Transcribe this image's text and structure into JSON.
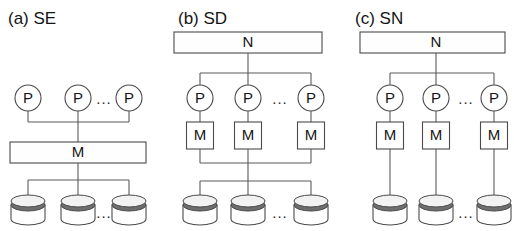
{
  "figure": {
    "background_color": "#ffffff",
    "line_color": "#5a5a5a",
    "text_color": "#141414",
    "disk_band_color": "#6e6e6e",
    "ellipsis": "...",
    "panels": [
      {
        "id": "panel-se",
        "title": "(a) SE",
        "architecture": "shared everything",
        "title_x": 8,
        "title_y": 24,
        "processors": {
          "label": "P",
          "count_shown": 3,
          "centers_x": [
            28,
            78,
            129
          ],
          "center_y": 98,
          "radius": 13
        },
        "memory_bar": {
          "label": "M",
          "x": 10,
          "y": 142,
          "width": 136,
          "height": 21
        },
        "disks": {
          "count_shown": 3,
          "centers_x": [
            28,
            78,
            129
          ],
          "top_y": 201,
          "width": 34,
          "height": 22
        },
        "buses": [
          {
            "name": "processor-bus",
            "y": 122,
            "x1": 28,
            "x2": 129
          },
          {
            "name": "disk-bus",
            "y": 180,
            "x1": 28,
            "x2": 129
          }
        ],
        "ellipsis_points": [
          {
            "x": 104,
            "y": 100
          },
          {
            "x": 104,
            "y": 214
          }
        ]
      },
      {
        "id": "panel-sd",
        "title": "(b) SD",
        "architecture": "shared disk",
        "title_x": 178,
        "title_y": 24,
        "network_bar": {
          "label": "N",
          "x": 174,
          "y": 32,
          "width": 148,
          "height": 21
        },
        "processors": {
          "label": "P",
          "count_shown": 3,
          "centers_x": [
            200,
            248,
            311
          ],
          "center_y": 98,
          "radius": 13
        },
        "memories": {
          "label": "M",
          "count_shown": 3,
          "centers_x": [
            200,
            248,
            311
          ],
          "y": 122,
          "width": 27,
          "height": 27
        },
        "disks": {
          "count_shown": 3,
          "centers_x": [
            200,
            248,
            311
          ],
          "top_y": 201,
          "width": 34,
          "height": 22
        },
        "buses": [
          {
            "name": "network-bus",
            "y": 73,
            "x1": 200,
            "x2": 311
          },
          {
            "name": "memory-bus",
            "y": 163,
            "x1": 200,
            "x2": 311
          },
          {
            "name": "disk-bus",
            "y": 181,
            "x1": 200,
            "x2": 311
          }
        ],
        "ellipsis_points": [
          {
            "x": 280,
            "y": 100
          },
          {
            "x": 280,
            "y": 214
          }
        ]
      },
      {
        "id": "panel-sn",
        "title": "(c) SN",
        "architecture": "shared nothing",
        "title_x": 355,
        "title_y": 24,
        "network_bar": {
          "label": "N",
          "x": 360,
          "y": 32,
          "width": 145,
          "height": 21
        },
        "processors": {
          "label": "P",
          "count_shown": 3,
          "centers_x": [
            390,
            436,
            494
          ],
          "center_y": 98,
          "radius": 13
        },
        "memories": {
          "label": "M",
          "count_shown": 3,
          "centers_x": [
            390,
            436,
            494
          ],
          "y": 122,
          "width": 27,
          "height": 27
        },
        "disks": {
          "count_shown": 3,
          "centers_x": [
            390,
            436,
            494
          ],
          "top_y": 201,
          "width": 34,
          "height": 22
        },
        "buses": [
          {
            "name": "network-bus",
            "y": 73,
            "x1": 390,
            "x2": 494
          }
        ],
        "ellipsis_points": [
          {
            "x": 466,
            "y": 100
          },
          {
            "x": 466,
            "y": 214
          }
        ]
      }
    ]
  }
}
